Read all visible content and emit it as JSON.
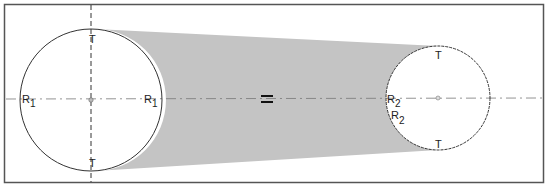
{
  "diagram": {
    "colors": {
      "background": "#ffffff",
      "frame": "#555555",
      "fill": "#c4c4c4",
      "line": "#333333"
    },
    "labels": {
      "c1_left": {
        "base": "R",
        "sub": "1"
      },
      "c1_right": {
        "base": "R",
        "sub": "1"
      },
      "c1_top": "T",
      "c1_bottom": "T",
      "c2_left": {
        "base": "R",
        "sub": "2"
      },
      "c2_inner": {
        "base": "R",
        "sub": "2"
      },
      "c2_top": "T",
      "c2_bottom": "T",
      "equals_sign": "="
    },
    "circles": [
      {
        "name": "large-pulley",
        "cx": 91,
        "cy": 100,
        "r": 71
      },
      {
        "name": "small-pulley",
        "cx": 438,
        "cy": 98,
        "r": 52
      }
    ]
  }
}
